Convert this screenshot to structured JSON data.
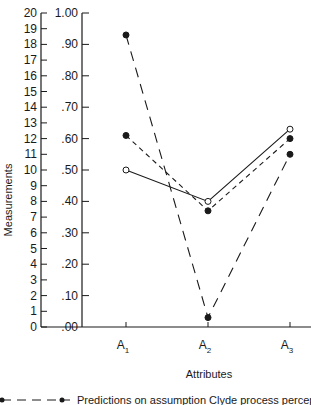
{
  "chart_data": {
    "type": "line",
    "title": "",
    "xlabel": "Attributes",
    "ylabel": "Measurements",
    "categories": [
      "A1",
      "A2",
      "A3"
    ],
    "category_labels": [
      {
        "base": "A",
        "sub": "1"
      },
      {
        "base": "A",
        "sub": "2"
      },
      {
        "base": "A",
        "sub": "3"
      }
    ],
    "left_axis": {
      "ticks": [
        "0",
        "1",
        "2",
        "3",
        "4",
        "5",
        "6",
        "7",
        "8",
        "9",
        "10",
        "11",
        "12",
        "13",
        "14",
        "15",
        "16",
        "17",
        "18",
        "19",
        "20"
      ],
      "range": [
        0,
        20
      ]
    },
    "right_axis": {
      "ticks": [
        ".00",
        ".10",
        ".20",
        ".30",
        ".40",
        ".50",
        ".60",
        ".70",
        ".80",
        ".90",
        "1.00"
      ],
      "range": [
        0,
        1.0
      ]
    },
    "ylim": [
      0,
      1.0
    ],
    "grid": false,
    "series": [
      {
        "name": "open-circle-solid",
        "marker": "open-circle",
        "line": "solid",
        "values": [
          0.5,
          0.4,
          0.63
        ]
      },
      {
        "name": "filled-circle-short-dash",
        "marker": "filled-circle",
        "line": "short-dash",
        "values": [
          0.61,
          0.37,
          0.6
        ]
      },
      {
        "name": "filled-circle-long-dash",
        "marker": "filled-circle",
        "line": "long-dash",
        "values": [
          0.93,
          0.03,
          0.55
        ]
      }
    ],
    "legend": {
      "position": "bottom",
      "entries": [
        {
          "text": "Predictions on assumption Clyde process perceptual"
        }
      ]
    }
  },
  "labels": {
    "ylabel": "Measurements",
    "xlabel": "Attributes",
    "legend_text": "Predictions on assumption Clyde process perceptual"
  }
}
